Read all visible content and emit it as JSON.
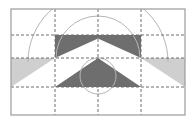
{
  "canvas": {
    "width": 195,
    "height": 124,
    "background": "#ffffff",
    "title": "Symmetric chevron geometric construction diagram"
  },
  "palette": {
    "background": "#ffffff",
    "border_gray": "#9b9b9b",
    "dark_gray": "#6e6e6e",
    "light_gray": "#cfcfcf",
    "dashed_gray": "#6e6e6e",
    "arc_gray": "#b5b5b5"
  },
  "frame": {
    "name": "outer-frame",
    "x": 11,
    "y": 9,
    "width": 174,
    "height": 106,
    "stroke": "#9b9b9b",
    "stroke_width": 1.2,
    "fill": "none"
  },
  "grid": {
    "dash_pattern": "3,2",
    "stroke": "#6e6e6e",
    "stroke_width": 1,
    "vertical_lines": [
      {
        "name": "grid-v-left",
        "x": 55
      },
      {
        "name": "grid-v-center",
        "x": 98
      },
      {
        "name": "grid-v-right",
        "x": 141
      }
    ],
    "horizontal_lines": [
      {
        "name": "grid-h-top",
        "y": 35
      },
      {
        "name": "grid-h-mid",
        "y": 58
      },
      {
        "name": "grid-h-bottom",
        "y": 87
      }
    ]
  },
  "shapes": {
    "upper_chevron": {
      "name": "upper-chevron-dark",
      "fill": "#6e6e6e",
      "description": "Dark rectangle spanning the middle band with a white triangular notch rising from its lower edge to the center",
      "points": "55,35 141,35 141,58 98,38.5 55,58"
    },
    "lower_chevron": {
      "name": "lower-chevron-dark",
      "fill": "#6e6e6e",
      "description": "Dark upward-pointing chevron whose apex touches the mid gridline",
      "points": "98,58 141,87 55,87"
    },
    "left_wing": {
      "name": "left-wing-light",
      "fill": "#cfcfcf",
      "description": "Light gray triangle filling the left band below the mid gridline",
      "points": "11,58 55,58 11,87"
    },
    "right_wing": {
      "name": "right-wing-light",
      "fill": "#cfcfcf",
      "description": "Light gray triangle filling the right band below the mid gridline",
      "points": "185,58 141,58 185,87"
    }
  },
  "arcs": {
    "stroke": "#b5b5b5",
    "stroke_width": 1,
    "items": [
      {
        "name": "outer-arc",
        "center_x": 98,
        "center_y": 62,
        "radius": 70,
        "start_angle_deg": 180,
        "end_angle_deg": 360,
        "description": "Large semicircular arc arching over the chevrons"
      },
      {
        "name": "middle-arc",
        "center_x": 98,
        "center_y": 58,
        "radius": 42,
        "start_angle_deg": 180,
        "end_angle_deg": 360,
        "description": "Medium semicircular arc"
      },
      {
        "name": "inner-circle",
        "center_x": 98,
        "center_y": 76,
        "radius": 18,
        "start_angle_deg": 0,
        "end_angle_deg": 360,
        "description": "Small full circle centered on the vertical axis"
      }
    ]
  }
}
